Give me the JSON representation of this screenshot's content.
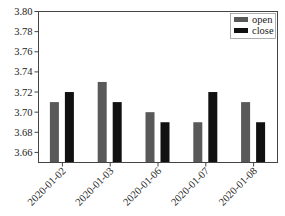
{
  "chart_data": {
    "type": "bar",
    "title": "",
    "xlabel": "",
    "ylabel": "",
    "categories": [
      "2020-01-02",
      "2020-01-03",
      "2020-01-06",
      "2020-01-07",
      "2020-01-08"
    ],
    "series": [
      {
        "name": "open",
        "values": [
          3.71,
          3.73,
          3.7,
          3.69,
          3.71
        ],
        "color": "#595959"
      },
      {
        "name": "close",
        "values": [
          3.72,
          3.71,
          3.69,
          3.72,
          3.69
        ],
        "color": "#111111"
      }
    ],
    "ylim": [
      3.65,
      3.8
    ],
    "yticks": [
      "3.66",
      "3.68",
      "3.70",
      "3.72",
      "3.74",
      "3.76",
      "3.78",
      "3.80"
    ],
    "legend_position": "upper right",
    "grid": false
  }
}
